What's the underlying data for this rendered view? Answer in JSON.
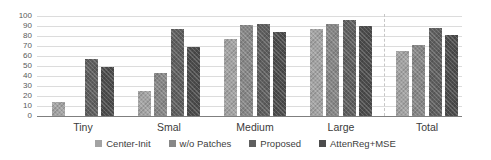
{
  "chart_data": {
    "type": "bar",
    "title": "",
    "xlabel": "",
    "ylabel": "",
    "ylim": [
      0,
      100
    ],
    "yticks": [
      0,
      10,
      20,
      30,
      40,
      50,
      60,
      70,
      80,
      90,
      100
    ],
    "grid": true,
    "legend_position": "bottom",
    "categories": [
      "Tiny",
      "Smal",
      "Medium",
      "Large",
      "Total"
    ],
    "series": [
      {
        "name": "Center-Init",
        "color": "#a3a3a3",
        "values": [
          14,
          25,
          77,
          87,
          65
        ]
      },
      {
        "name": "w/o Patches",
        "color": "#878787",
        "values": [
          0,
          43,
          91,
          92,
          71
        ]
      },
      {
        "name": "Proposed",
        "color": "#5f5f5f",
        "values": [
          57,
          87,
          92,
          96,
          88
        ]
      },
      {
        "name": "AttenReg+MSE",
        "color": "#4c4c4c",
        "values": [
          49,
          69,
          84,
          90,
          81
        ]
      }
    ],
    "separator_before_category": "Total"
  },
  "colors": {
    "gridline": "#dcdcdc",
    "axis": "#7f7f7f",
    "tick_text": "#595959",
    "category_text": "#3b3b3b",
    "legend_text": "#404040",
    "separator": "#c6c6c6"
  }
}
